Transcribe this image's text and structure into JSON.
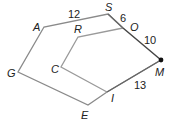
{
  "diagram": {
    "type": "geometry-polygons",
    "outer_polygon": {
      "name": "GASMIE",
      "vertices": [
        "G",
        "A",
        "S",
        "M",
        "I",
        "E"
      ]
    },
    "inner_polygon": {
      "name": "CROMI",
      "vertices": [
        "C",
        "R",
        "O",
        "M",
        "I"
      ]
    },
    "points": {
      "A": {
        "label": "A",
        "x": 44,
        "y": 27
      },
      "S": {
        "label": "S",
        "x": 108,
        "y": 14
      },
      "O": {
        "label": "O",
        "x": 123,
        "y": 28
      },
      "M": {
        "label": "M",
        "x": 161,
        "y": 60
      },
      "I": {
        "label": "I",
        "x": 107,
        "y": 92
      },
      "E": {
        "label": "E",
        "x": 88,
        "y": 105
      },
      "G": {
        "label": "G",
        "x": 18,
        "y": 72
      },
      "R": {
        "label": "R",
        "x": 78,
        "y": 37
      },
      "C": {
        "label": "C",
        "x": 61,
        "y": 67
      }
    },
    "measurements": [
      {
        "segment": "AS",
        "value": "12"
      },
      {
        "segment": "SO",
        "value": "6"
      },
      {
        "segment": "OM",
        "value": "10"
      },
      {
        "segment": "MI",
        "value": "13"
      }
    ],
    "colors": {
      "outer_line": "#888888",
      "inner_line": "#999999",
      "shared_line": "#444444",
      "point": "#111111"
    }
  }
}
